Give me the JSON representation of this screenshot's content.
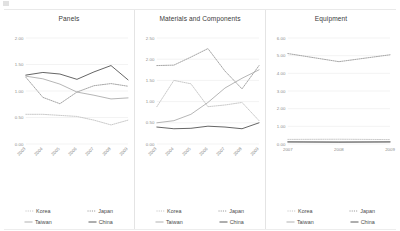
{
  "document": {
    "background_color": "#ffffff",
    "series_colors": {
      "korea": "#bdbdbd",
      "japan": "#8f8f8f",
      "taiwan": "#a8a8a8",
      "china": "#4a4a4a"
    }
  },
  "panels": [
    {
      "title": "Panels",
      "legend": [
        {
          "label": "Korea",
          "style": "dotted",
          "color": "#bdbdbd"
        },
        {
          "label": "Japan",
          "style": "dotted",
          "color": "#8f8f8f"
        },
        {
          "label": "Taiwan",
          "style": "solid",
          "color": "#a8a8a8"
        },
        {
          "label": "China",
          "style": "solid",
          "color": "#4a4a4a"
        }
      ]
    },
    {
      "title": "Materials and Components",
      "legend": [
        {
          "label": "Korea",
          "style": "dotted",
          "color": "#bdbdbd"
        },
        {
          "label": "Japan",
          "style": "dotted",
          "color": "#8f8f8f"
        },
        {
          "label": "Taiwan",
          "style": "solid",
          "color": "#a8a8a8"
        },
        {
          "label": "China",
          "style": "solid",
          "color": "#4a4a4a"
        }
      ]
    },
    {
      "title": "Equipment",
      "legend": [
        {
          "label": "Korea",
          "style": "dotted",
          "color": "#bdbdbd"
        },
        {
          "label": "Japan",
          "style": "dotted",
          "color": "#8f8f8f"
        },
        {
          "label": "Taiwan",
          "style": "solid",
          "color": "#a8a8a8"
        },
        {
          "label": "China",
          "style": "solid",
          "color": "#4a4a4a"
        }
      ]
    }
  ],
  "chart_data": [
    {
      "type": "line",
      "title": "Panels",
      "xlabel": "",
      "ylabel": "",
      "x": [
        "2003",
        "2004",
        "2005",
        "2006",
        "2007",
        "2008",
        "2009"
      ],
      "ylim": [
        0.0,
        2.0
      ],
      "yticks": [
        "0.00",
        "0.50",
        "1.00",
        "1.50",
        "2.00"
      ],
      "ytick_values": [
        0.0,
        0.5,
        1.0,
        1.5,
        2.0
      ],
      "grid": true,
      "legend_position": "bottom",
      "series": [
        {
          "name": "Korea",
          "style": "dotted",
          "color": "#bdbdbd",
          "values": [
            0.56,
            0.56,
            0.54,
            0.52,
            0.45,
            0.36,
            0.45
          ]
        },
        {
          "name": "Japan",
          "style": "dotted",
          "color": "#8f8f8f",
          "values": [
            1.26,
            0.88,
            0.76,
            0.98,
            1.1,
            1.14,
            1.09
          ]
        },
        {
          "name": "Taiwan",
          "style": "solid",
          "color": "#a8a8a8",
          "values": [
            1.28,
            1.23,
            1.13,
            0.98,
            0.92,
            0.85,
            0.87
          ]
        },
        {
          "name": "China",
          "style": "solid",
          "color": "#4a4a4a",
          "values": [
            1.3,
            1.35,
            1.32,
            1.22,
            1.36,
            1.48,
            1.21
          ]
        }
      ]
    },
    {
      "type": "line",
      "title": "Materials and Components",
      "xlabel": "",
      "ylabel": "",
      "x": [
        "2003",
        "2004",
        "2005",
        "2006",
        "2007",
        "2008",
        "2009"
      ],
      "ylim": [
        0.0,
        2.5
      ],
      "yticks": [
        "0.00",
        "0.50",
        "1.00",
        "1.50",
        "2.00",
        "2.50"
      ],
      "ytick_values": [
        0.0,
        0.5,
        1.0,
        1.5,
        2.0,
        2.5
      ],
      "grid": true,
      "legend_position": "bottom",
      "series": [
        {
          "name": "Korea",
          "style": "dotted",
          "color": "#bdbdbd",
          "values": [
            0.88,
            1.5,
            1.42,
            0.88,
            0.92,
            0.98,
            0.55
          ]
        },
        {
          "name": "Japan",
          "style": "dotted",
          "color": "#8f8f8f",
          "values": [
            1.85,
            1.86,
            2.05,
            2.25,
            1.72,
            1.3,
            1.85
          ]
        },
        {
          "name": "Taiwan",
          "style": "solid",
          "color": "#a8a8a8",
          "values": [
            0.5,
            0.55,
            0.7,
            0.98,
            1.32,
            1.55,
            1.75
          ]
        },
        {
          "name": "China",
          "style": "solid",
          "color": "#4a4a4a",
          "values": [
            0.4,
            0.36,
            0.37,
            0.42,
            0.4,
            0.36,
            0.5
          ]
        }
      ]
    },
    {
      "type": "line",
      "title": "Equipment",
      "xlabel": "",
      "ylabel": "",
      "x": [
        "2007",
        "2008",
        "2009"
      ],
      "ylim": [
        0.0,
        6.0
      ],
      "yticks": [
        "0.00",
        "1.00",
        "2.00",
        "3.00",
        "4.00",
        "5.00",
        "6.00"
      ],
      "ytick_values": [
        0.0,
        1.0,
        2.0,
        3.0,
        4.0,
        5.0,
        6.0
      ],
      "grid": true,
      "legend_position": "bottom",
      "series": [
        {
          "name": "Korea",
          "style": "dotted",
          "color": "#bdbdbd",
          "values": [
            0.26,
            0.27,
            0.25
          ]
        },
        {
          "name": "Japan",
          "style": "dotted",
          "color": "#8f8f8f",
          "values": [
            5.12,
            4.66,
            5.05
          ]
        },
        {
          "name": "Taiwan",
          "style": "solid",
          "color": "#a8a8a8",
          "values": [
            0.14,
            0.13,
            0.14
          ]
        },
        {
          "name": "China",
          "style": "solid",
          "color": "#4a4a4a",
          "values": [
            0.11,
            0.1,
            0.11
          ]
        }
      ]
    }
  ]
}
